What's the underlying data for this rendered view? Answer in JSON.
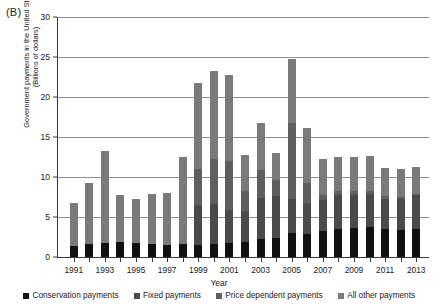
{
  "panel": {
    "label": "(B)"
  },
  "chart_data": {
    "type": "bar",
    "stacked": true,
    "title": "",
    "panel_label": "(B)",
    "xlabel": "Year",
    "ylabel_line1": "Government payments in the United States",
    "ylabel_line2": "(Billions of dollars)",
    "ylim": [
      0,
      30
    ],
    "yticks": [
      0,
      5,
      10,
      15,
      20,
      25,
      30
    ],
    "grid": "horizontal",
    "legend_position": "bottom",
    "categories": [
      "1991",
      "1992",
      "1993",
      "1994",
      "1995",
      "1996",
      "1997",
      "1998",
      "1999",
      "2000",
      "2001",
      "2002",
      "2003",
      "2004",
      "2005",
      "2006",
      "2007",
      "2008",
      "2009",
      "2010",
      "2011",
      "2012",
      "2013"
    ],
    "tick_labels": [
      "1991",
      "1993",
      "1995",
      "1997",
      "1999",
      "2001",
      "2003",
      "2005",
      "2007",
      "2009",
      "2011",
      "2013"
    ],
    "series": [
      {
        "name": "Conservation payments",
        "color": "#111111",
        "values": [
          1.4,
          1.6,
          1.8,
          1.9,
          1.8,
          1.6,
          1.5,
          1.6,
          1.5,
          1.6,
          1.8,
          1.9,
          2.2,
          2.4,
          3.0,
          2.9,
          3.2,
          3.5,
          3.6,
          3.7,
          3.5,
          3.4,
          3.5
        ]
      },
      {
        "name": "Fixed payments",
        "color": "#4a4a4a",
        "values": [
          0.0,
          0.0,
          0.0,
          0.0,
          0.0,
          0.0,
          0.0,
          0.0,
          5.0,
          5.0,
          4.1,
          3.9,
          5.2,
          5.2,
          4.3,
          3.9,
          3.9,
          4.3,
          4.2,
          4.2,
          3.8,
          3.9,
          4.2
        ]
      },
      {
        "name": "Price dependent payments",
        "color": "#5f5f5f",
        "values": [
          0.0,
          0.0,
          0.0,
          0.0,
          0.0,
          0.0,
          0.0,
          0.0,
          4.5,
          5.6,
          6.1,
          2.5,
          3.5,
          2.0,
          9.5,
          2.5,
          0.6,
          0.4,
          0.5,
          0.3,
          0.3,
          0.2,
          0.2
        ]
      },
      {
        "name": "All other payments",
        "color": "#7a7a7a",
        "values": [
          5.3,
          7.6,
          11.5,
          5.9,
          5.5,
          6.3,
          6.5,
          10.9,
          10.7,
          11.1,
          10.8,
          4.5,
          5.9,
          3.4,
          7.9,
          6.8,
          4.5,
          4.3,
          4.2,
          4.4,
          3.5,
          3.5,
          3.4
        ]
      }
    ],
    "totals": [
      8.2,
      9.2,
      13.3,
      7.8,
      7.3,
      7.9,
      8.0,
      12.5,
      21.7,
      23.3,
      22.8,
      12.8,
      16.8,
      13.0,
      24.7,
      16.1,
      12.2,
      12.5,
      12.5,
      12.6,
      11.1,
      11.0,
      11.3
    ],
    "legend": [
      {
        "label": "Conservation payments",
        "color": "#111111"
      },
      {
        "label": "Fixed payments",
        "color": "#4a4a4a"
      },
      {
        "label": "Price dependent payments",
        "color": "#5f5f5f"
      },
      {
        "label": "All other payments",
        "color": "#7a7a7a"
      }
    ]
  }
}
